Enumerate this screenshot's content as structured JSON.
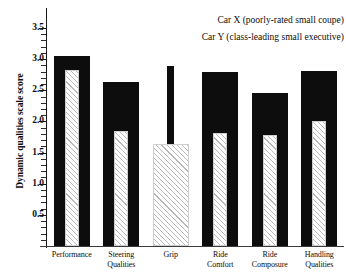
{
  "chart_data": {
    "type": "bar",
    "title": "",
    "subtitle": "",
    "xlabel": "",
    "ylabel": "Dynamic qualities scale score",
    "ylim": [
      0,
      3.5
    ],
    "ytick_labels": [
      "0.5",
      "1.0",
      "1.5",
      "2.0",
      "2.5",
      "3.0",
      "3.5"
    ],
    "ytick_values": [
      0.5,
      1.0,
      1.5,
      2.0,
      2.5,
      3.0,
      3.5
    ],
    "minor_tick_interval": 0.1,
    "grid": false,
    "legend_position": "top-right",
    "categories": [
      "Performance",
      "Steering Qualities",
      "Grip",
      "Ride Comfort",
      "Ride Composure",
      "Handling Qualities"
    ],
    "category_lines": [
      [
        "Performance"
      ],
      [
        "Steering",
        "Qualities"
      ],
      [
        "Grip"
      ],
      [
        "Ride",
        "Comfort"
      ],
      [
        "Ride",
        "Composure"
      ],
      [
        "Handling",
        "Qualities"
      ]
    ],
    "series": [
      {
        "name": "Car X (poorly-rated small coupe)",
        "short_name": "Car X",
        "style": "solid-black",
        "color": "#0d0d0d",
        "values": [
          3.05,
          2.63,
          2.89,
          2.8,
          2.45,
          2.81
        ]
      },
      {
        "name": "Car Y (class-leading small executive)",
        "short_name": "Car Y",
        "style": "diagonal-hatch",
        "color": "#b9b9b9",
        "values": [
          2.82,
          1.84,
          1.64,
          1.82,
          1.78,
          2.0
        ]
      }
    ]
  },
  "legend": {
    "entries": [
      "Car X (poorly-rated small coupe)",
      "Car Y (class-leading small executive)"
    ]
  }
}
